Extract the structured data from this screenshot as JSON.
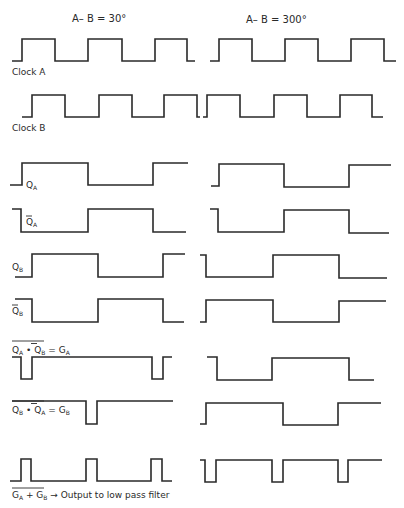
{
  "headers": {
    "left": "A– B = 30°",
    "right": "A– B = 300°"
  },
  "labels": {
    "clock_a": "Clock  A",
    "clock_b": "Clock  B",
    "qa": "Q",
    "qa_sub": "A",
    "qa_bar": "Q",
    "qa_bar_sub": "A",
    "qb": "Q",
    "qb_sub": "B",
    "qb_bar": "Q",
    "qb_bar_sub": "B",
    "ga_expr": "Q",
    "ga_expr_sub1": "A",
    "ga_dot": " • ",
    "ga_expr2": "Q",
    "ga_expr_sub2": "B",
    "ga_eq": " = G",
    "ga_eq_sub": "A",
    "gb_expr": "Q",
    "gb_expr_sub1": "B",
    "gb_dot": " • ",
    "gb_expr2": "Q",
    "gb_expr_sub2": "A",
    "gb_eq": " = G",
    "gb_eq_sub": "B",
    "out_g1": "G",
    "out_g1_sub": "A",
    "out_plus": " + G",
    "out_g2_sub": "B",
    "out_arrow": " → ",
    "out_text": "Output to low pass filter"
  },
  "waveforms": {
    "left": {
      "clock_a": "12,61 22,61 22,39 55,39 55,61 88,61 88,39 122,39 122,61 155,61 155,39 187,39 187,61 195,61",
      "clock_b": "22,117 32,117 32,95 65,95 65,117 99,117 99,95 132,95 132,117 164,117 164,95 197,95 197,117 200,117",
      "qa": "10,185 22,185 22,163 88,163 88,185 153,185 153,163 188,163",
      "qa_bar": "12,209 21,209 21,232 88,232 88,209 153,209 153,232 186,232",
      "qb": "15,277 32,277 32,254 98,254 98,277 163,277 163,254 185,254",
      "qb_bar": "15,299 32,299 32,322 98,322 98,299 163,299 163,322 184,322",
      "ga": "12,357 21,357 21,379 32,379 32,357 152,357 152,379 163,379 163,357 172,357",
      "gb": "12,401 86,401 86,424 97,424 97,401 173,401",
      "out": "10,481 21,481 21,459 31,459 31,481 86,481 86,459 97,459 97,481 151,481 151,459 162,459 162,481 172,481"
    },
    "right": {
      "clock_a": "210,61 219,61 219,39 252,39 252,61 285,61 285,39 318,39 318,61 351,61 351,39 384,39 384,61 396,61",
      "clock_b": "203,117 207,117 207,95 240,95 240,117 274,117 274,95 307,95 307,117 340,117 340,95 372,95 372,117 383,117",
      "qa": "211,186 219,186 219,164 284,164 284,187 349,187 349,165 391,165",
      "qa_bar": "210,209 218,209 218,232 284,232 284,210 349,210 349,233 389,233",
      "qb": "200,255 206,255 206,277 273,277 273,255 339,255 339,278 387,278",
      "qb_bar": "200,322 206,322 206,300 273,300 273,322 339,322 339,301 386,301",
      "ga": "207,357 217,357 217,380 272,380 272,358 349,358 349,380 374,380",
      "gb": "200,424 206,424 206,403 283,403 283,425 338,425 338,403 381,403",
      "out": "200,460 205,460 205,482 216,482 216,460 272,460 272,482 283,482 283,460 338,460 338,482 348,482 348,460 382,460"
    }
  },
  "colors": {
    "ink": "#2a2a2a",
    "background": "#ffffff"
  }
}
